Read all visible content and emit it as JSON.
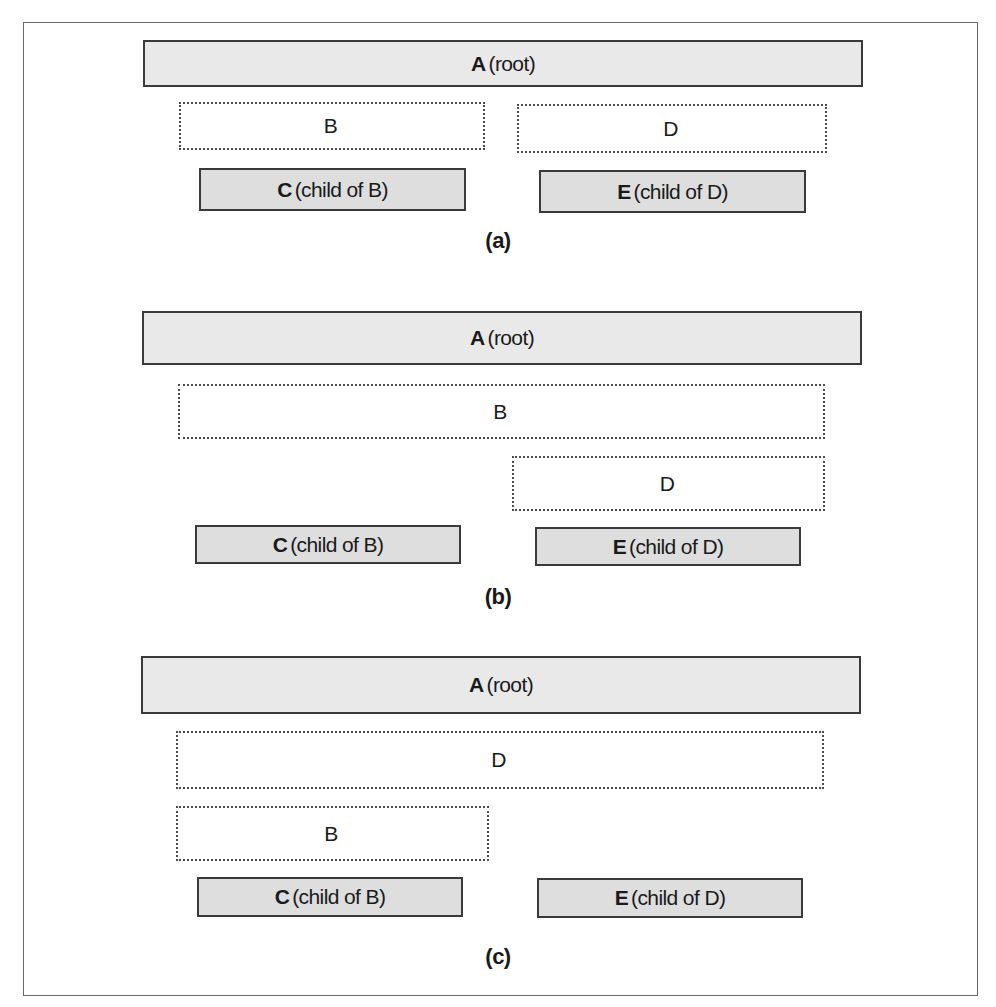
{
  "figures": [
    {
      "caption": "(a)",
      "boxes": {
        "A": {
          "lead": "A",
          "rest": "(root)"
        },
        "B": {
          "lead": "B",
          "rest": ""
        },
        "D": {
          "lead": "D",
          "rest": ""
        },
        "C": {
          "lead": "C",
          "rest": "(child of B)"
        },
        "E": {
          "lead": "E",
          "rest": "(child of D)"
        }
      }
    },
    {
      "caption": "(b)",
      "boxes": {
        "A": {
          "lead": "A",
          "rest": "(root)"
        },
        "B": {
          "lead": "B",
          "rest": ""
        },
        "D": {
          "lead": "D",
          "rest": ""
        },
        "C": {
          "lead": "C",
          "rest": "(child of B)"
        },
        "E": {
          "lead": "E",
          "rest": "(child of D)"
        }
      }
    },
    {
      "caption": "(c)",
      "boxes": {
        "A": {
          "lead": "A",
          "rest": "(root)"
        },
        "D": {
          "lead": "D",
          "rest": ""
        },
        "B": {
          "lead": "B",
          "rest": ""
        },
        "C": {
          "lead": "C",
          "rest": "(child of B)"
        },
        "E": {
          "lead": "E",
          "rest": "(child of D)"
        }
      }
    }
  ],
  "colors": {
    "root_fill": "#e9e9e9",
    "child_fill": "#dedede",
    "border": "#3a3a3a",
    "dashed_border": "#4a4a4a"
  }
}
